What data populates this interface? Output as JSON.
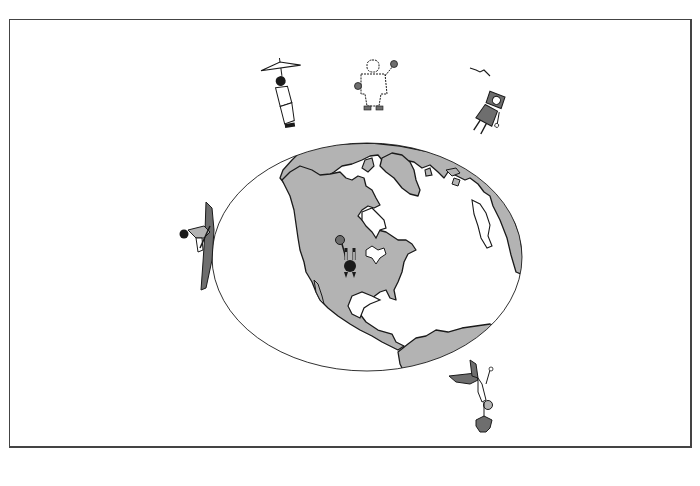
{
  "figure": {
    "colors": {
      "background": "#ffffff",
      "frame_border": "#444444",
      "ocean": "#ffffff",
      "land": "#b3b3b3",
      "outline": "#1a1a1a",
      "figure_dark": "#6e6e6e"
    },
    "figures": [
      {
        "id": "umbrella-person",
        "position": "top-left of globe",
        "orientation": "upright, tilted"
      },
      {
        "id": "snowsuit-person",
        "position": "top of globe",
        "orientation": "upright, waving"
      },
      {
        "id": "hat-person",
        "position": "top-right of globe",
        "orientation": "tilted right",
        "extra": "bird in sky"
      },
      {
        "id": "surfboard-person",
        "position": "left edge of globe",
        "orientation": "sideways"
      },
      {
        "id": "center-person",
        "position": "center of North America",
        "orientation": "upside down / seen from above"
      },
      {
        "id": "hanging-person",
        "position": "bottom-right of globe",
        "orientation": "upside down"
      }
    ]
  }
}
